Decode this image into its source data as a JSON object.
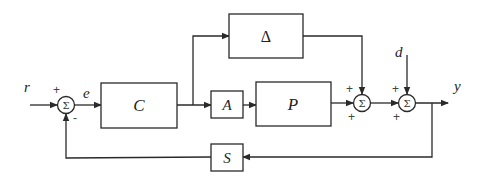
{
  "diagram": {
    "type": "control-block-diagram",
    "signals": {
      "reference": "r",
      "error": "e",
      "disturbance": "d",
      "output": "y"
    },
    "blocks": {
      "controller": "C",
      "uncertainty": "Δ",
      "actuator": "A",
      "plant": "P",
      "sensor": "S"
    },
    "summing_junctions": {
      "symbol": "Σ",
      "sum1": {
        "inputs": [
          "+",
          "-"
        ]
      },
      "sum2": {
        "inputs": [
          "+",
          "+"
        ]
      },
      "sum3": {
        "inputs": [
          "+",
          "+"
        ]
      }
    },
    "colors": {
      "line": "#2a2a2a",
      "background": "#ffffff"
    }
  }
}
